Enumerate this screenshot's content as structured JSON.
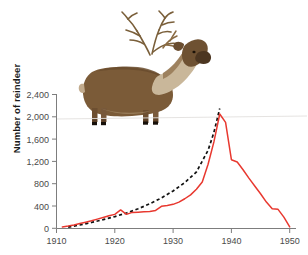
{
  "figure": {
    "title": "",
    "animal_illustration": "reindeer-illustration"
  },
  "chart_data": {
    "type": "line",
    "title": "",
    "xlabel": "",
    "ylabel": "Number of reindeer",
    "xlim": [
      1910,
      1950
    ],
    "ylim": [
      0,
      2400
    ],
    "xticks": [
      1910,
      1920,
      1930,
      1940,
      1950
    ],
    "xtick_labels": [
      "1910",
      "1920",
      "1930",
      "1940",
      "1950"
    ],
    "yticks": [
      0,
      400,
      800,
      1200,
      1600,
      2000,
      2400
    ],
    "ytick_labels": [
      "0",
      "400",
      "800",
      "1,200",
      "1,600",
      "2,000",
      "2,400"
    ],
    "grid": false,
    "legend": "none",
    "series": [
      {
        "name": "Observed reindeer population",
        "style": "solid",
        "color": "#e8382f",
        "x": [
          1911,
          1912,
          1913,
          1914,
          1915,
          1916,
          1917,
          1918,
          1919,
          1920,
          1921,
          1922,
          1923,
          1924,
          1925,
          1926,
          1927,
          1928,
          1929,
          1930,
          1931,
          1932,
          1933,
          1934,
          1935,
          1936,
          1937,
          1938,
          1939,
          1940,
          1941,
          1942,
          1943,
          1944,
          1945,
          1946,
          1947,
          1948,
          1949,
          1950
        ],
        "values": [
          25,
          40,
          60,
          85,
          110,
          135,
          165,
          195,
          225,
          250,
          330,
          250,
          285,
          290,
          295,
          300,
          320,
          395,
          410,
          430,
          470,
          530,
          600,
          700,
          830,
          1150,
          1550,
          2050,
          1900,
          1230,
          1190,
          1050,
          900,
          760,
          620,
          470,
          350,
          340,
          200,
          25
        ]
      },
      {
        "name": "Exponential growth model",
        "style": "dashed",
        "color": "#111111",
        "x": [
          1912,
          1914,
          1916,
          1918,
          1920,
          1922,
          1924,
          1926,
          1928,
          1930,
          1932,
          1934,
          1936,
          1937,
          1938
        ],
        "values": [
          20,
          60,
          105,
          155,
          210,
          275,
          350,
          440,
          545,
          670,
          820,
          1010,
          1400,
          1720,
          2150
        ]
      }
    ],
    "annotations": []
  }
}
